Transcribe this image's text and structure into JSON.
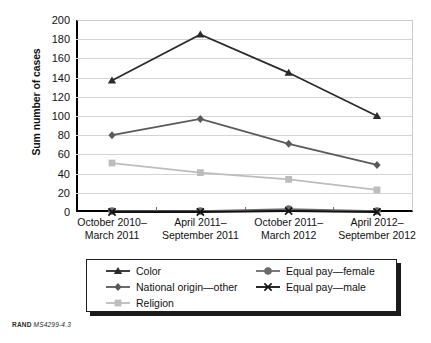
{
  "figure": {
    "footer_brand": "RAND",
    "footer_id": "MS4299-4.3"
  },
  "chart_data": {
    "type": "line",
    "title": "",
    "xlabel": "",
    "ylabel": "Sum number of cases",
    "ylim": [
      0,
      200
    ],
    "ytick_step": 20,
    "yticks": [
      200,
      180,
      160,
      140,
      120,
      100,
      80,
      60,
      40,
      20,
      0
    ],
    "grid": true,
    "legend_position": "bottom",
    "categories": [
      "October 2010–\nMarch 2011",
      "April 2011–\nSeptember 2011",
      "October 2011–\nMarch 2012",
      "April 2012–\nSeptember 2012"
    ],
    "categories_lines": [
      [
        "October 2010–",
        "March 2011"
      ],
      [
        "April 2011–",
        "September 2011"
      ],
      [
        "October 2011–",
        "March 2012"
      ],
      [
        "April 2012–",
        "September 2012"
      ]
    ],
    "series": [
      {
        "name": "Color",
        "marker": "triangle",
        "color": "#2b2b2b",
        "values": [
          137,
          185,
          145,
          100
        ]
      },
      {
        "name": "National origin—other",
        "marker": "diamond",
        "color": "#5a5a5a",
        "values": [
          80,
          97,
          71,
          49
        ]
      },
      {
        "name": "Religion",
        "marker": "square",
        "color": "#bdbdbd",
        "values": [
          51,
          41,
          34,
          23
        ]
      },
      {
        "name": "Equal pay—female",
        "marker": "circle",
        "color": "#6b6b6b",
        "values": [
          1,
          1,
          3,
          1
        ]
      },
      {
        "name": "Equal pay—male",
        "marker": "x",
        "color": "#111111",
        "values": [
          0,
          0,
          1,
          0
        ]
      }
    ]
  },
  "legend": {
    "items": [
      {
        "label": "Color",
        "marker": "triangle",
        "color": "#2b2b2b"
      },
      {
        "label": "Equal pay—female",
        "marker": "circle",
        "color": "#6b6b6b"
      },
      {
        "label": "National origin—other",
        "marker": "diamond",
        "color": "#5a5a5a"
      },
      {
        "label": "Equal pay—male",
        "marker": "x",
        "color": "#111111"
      },
      {
        "label": "Religion",
        "marker": "square",
        "color": "#bdbdbd"
      }
    ]
  }
}
